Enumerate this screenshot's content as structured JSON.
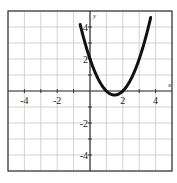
{
  "chart_data": {
    "type": "line",
    "title": "",
    "xlabel": "x",
    "ylabel": "y",
    "xlim": [
      -5,
      5
    ],
    "ylim": [
      -5,
      5
    ],
    "grid": true,
    "x_ticks": [
      -4,
      -2,
      2,
      4
    ],
    "y_ticks": [
      4,
      2,
      -2,
      -4
    ],
    "x_tick_labels": [
      "-4",
      "-2",
      "2",
      "4"
    ],
    "y_tick_labels": [
      "4",
      "2",
      "-2",
      "-4"
    ],
    "series": [
      {
        "name": "parabola",
        "equation": "y = x^2 - 3x + 2",
        "x": [
          -0.6,
          -0.5,
          0,
          0.5,
          1,
          1.5,
          2,
          2.5,
          3,
          3.5,
          3.7
        ],
        "y": [
          4.16,
          3.75,
          2,
          0.75,
          0,
          -0.25,
          0,
          0.75,
          2,
          3.75,
          4.59
        ],
        "vertex": [
          1.5,
          -0.25
        ],
        "roots": [
          1,
          2
        ],
        "y_intercept": 2
      }
    ],
    "legend": null
  },
  "axes": {
    "x_label": "x",
    "y_label": "y"
  },
  "colors": {
    "curve": "#111111",
    "grid": "#c8c8c8",
    "axis": "#333333",
    "frame": "#333333"
  }
}
